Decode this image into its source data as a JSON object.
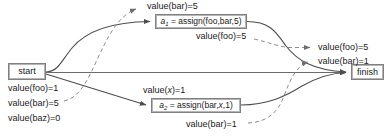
{
  "diagram": {
    "nodes": {
      "start": {
        "label": "start"
      },
      "finish": {
        "label": "finish"
      },
      "a1": {
        "name": "a",
        "index": "1",
        "text": " = assign(foo,bar,5)"
      },
      "a2": {
        "name": "a",
        "index": "2",
        "text": " = assign(bar,",
        "var": "x",
        "text2": ",1)"
      }
    },
    "labels": {
      "start_foo": "value(foo)=1",
      "start_bar": "value(bar)=5",
      "start_baz": "value(baz)=0",
      "top_bar": "value(bar)=5",
      "mid_foo": "value(foo)=5",
      "x_pre": "value(",
      "x_var": "x",
      "x_post": ")=1",
      "bottom_bar": "value(bar)=1",
      "out_foo": "value(foo)=5",
      "out_bar": "value(bar)=1"
    },
    "colors": {
      "edge_solid": "#4d4d4d",
      "edge_dashed": "#8c8c8c",
      "node_border": "#808080",
      "text": "#1a1a1a",
      "background": "#ffffff"
    },
    "edges": {
      "solid_description": "control flow edges",
      "dashed_description": "data dependency edges"
    }
  }
}
